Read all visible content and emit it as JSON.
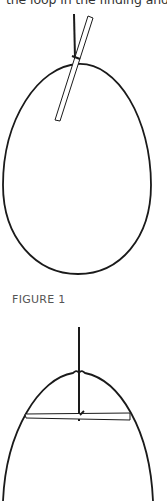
{
  "document": {
    "top_text": "the loop in the finding and",
    "figure_label": "FIGURE 1"
  },
  "colors": {
    "stroke": "#1a1a1a",
    "label": "#555555"
  },
  "figures": [
    {
      "name": "egg-with-angled-needle",
      "description": "Egg outline with thread entering top and a needle inserted at an angle"
    },
    {
      "name": "egg-with-horizontal-needle",
      "description": "Egg outline with thread entering top and a needle lying horizontally inside"
    }
  ]
}
